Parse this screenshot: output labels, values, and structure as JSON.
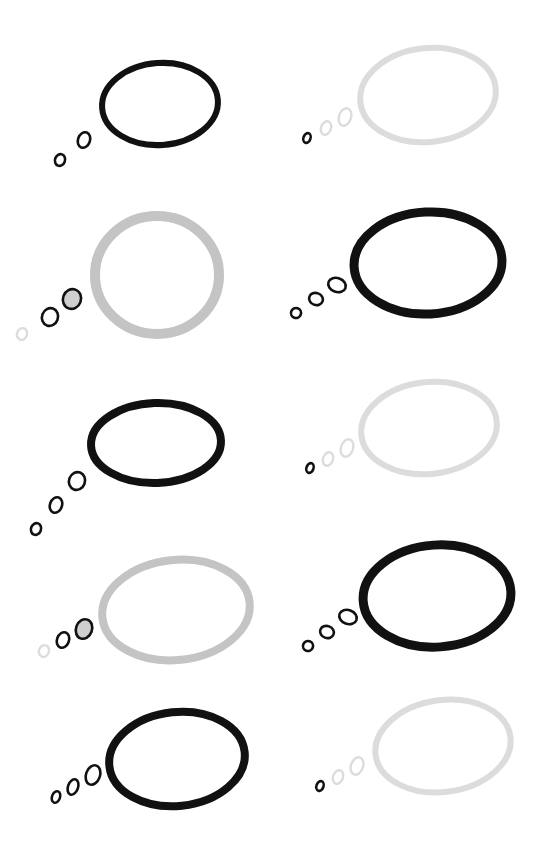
{
  "colors": {
    "black": "#111111",
    "mid_grey": "#c4c4c4",
    "light_grey": "#dcdcdc",
    "mid_grey_fill": "#cfcfcf",
    "background": "#ffffff"
  },
  "bubbles": [
    {
      "id": "bubble-1",
      "outline": "black",
      "dots": [
        "black",
        "black"
      ],
      "dot_fill": [
        null,
        null
      ]
    },
    {
      "id": "bubble-2",
      "outline": "light_grey",
      "dots": [
        "black",
        "light_grey",
        "light_grey"
      ],
      "dot_fill": [
        null,
        null,
        null
      ]
    },
    {
      "id": "bubble-3",
      "outline": "mid_grey",
      "dots": [
        "light_grey",
        "black",
        "black"
      ],
      "dot_fill": [
        null,
        null,
        "mid_grey_fill"
      ]
    },
    {
      "id": "bubble-4",
      "outline": "black",
      "dots": [
        "black",
        "black",
        "black"
      ],
      "dot_fill": [
        null,
        null,
        null
      ]
    },
    {
      "id": "bubble-5",
      "outline": "black",
      "dots": [
        "black",
        "black",
        "black"
      ],
      "dot_fill": [
        null,
        null,
        null
      ]
    },
    {
      "id": "bubble-6",
      "outline": "light_grey",
      "dots": [
        "black",
        "light_grey",
        "light_grey"
      ],
      "dot_fill": [
        null,
        null,
        null
      ]
    },
    {
      "id": "bubble-7",
      "outline": "mid_grey",
      "dots": [
        "light_grey",
        "black",
        "black"
      ],
      "dot_fill": [
        null,
        null,
        "mid_grey_fill"
      ]
    },
    {
      "id": "bubble-8",
      "outline": "black",
      "dots": [
        "black",
        "black",
        "black"
      ],
      "dot_fill": [
        null,
        null,
        null
      ]
    },
    {
      "id": "bubble-9",
      "outline": "black",
      "dots": [
        "black",
        "black",
        "black"
      ],
      "dot_fill": [
        null,
        null,
        null
      ]
    },
    {
      "id": "bubble-10",
      "outline": "light_grey",
      "dots": [
        "black",
        "light_grey",
        "light_grey"
      ],
      "dot_fill": [
        null,
        null,
        null
      ]
    }
  ]
}
